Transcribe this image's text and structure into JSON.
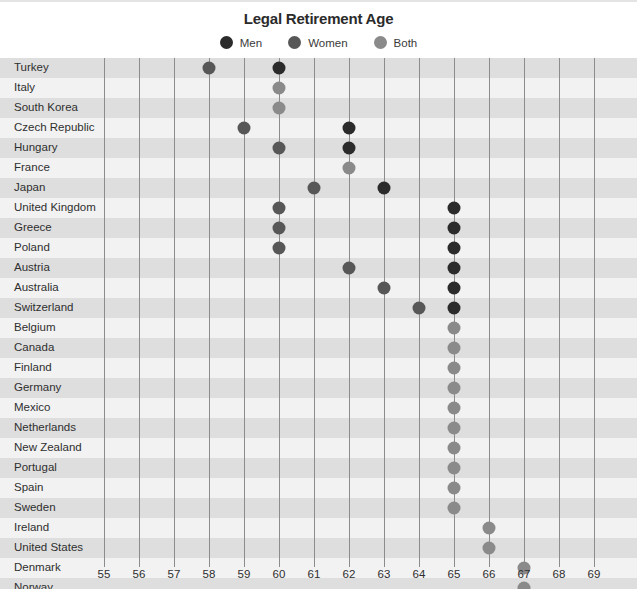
{
  "chart_data": {
    "type": "scatter",
    "title": "Legal Retirement Age",
    "xlabel": "",
    "ylabel": "",
    "xlim": [
      54.5,
      69.5
    ],
    "xticks": [
      55,
      56,
      57,
      58,
      59,
      60,
      61,
      62,
      63,
      64,
      65,
      66,
      67,
      68,
      69
    ],
    "grid": true,
    "legend_position": "top-center",
    "series": [
      {
        "name": "Men",
        "color": "#2b2b2b"
      },
      {
        "name": "Women",
        "color": "#575757"
      },
      {
        "name": "Both",
        "color": "#8a8a8a"
      }
    ],
    "categories": [
      "Turkey",
      "Italy",
      "South Korea",
      "Czech Republic",
      "Hungary",
      "France",
      "Japan",
      "United Kingdom",
      "Greece",
      "Poland",
      "Austria",
      "Australia",
      "Switzerland",
      "Belgium",
      "Canada",
      "Finland",
      "Germany",
      "Mexico",
      "Netherlands",
      "New Zealand",
      "Portugal",
      "Spain",
      "Sweden",
      "Ireland",
      "United States",
      "Denmark",
      "Norway"
    ],
    "rows": [
      {
        "country": "Turkey",
        "men": 60,
        "women": 58,
        "both": null
      },
      {
        "country": "Italy",
        "men": null,
        "women": null,
        "both": 60
      },
      {
        "country": "South Korea",
        "men": null,
        "women": null,
        "both": 60
      },
      {
        "country": "Czech Republic",
        "men": 62,
        "women": 59,
        "both": null
      },
      {
        "country": "Hungary",
        "men": 62,
        "women": 60,
        "both": null
      },
      {
        "country": "France",
        "men": null,
        "women": null,
        "both": 62
      },
      {
        "country": "Japan",
        "men": 63,
        "women": 61,
        "both": null
      },
      {
        "country": "United Kingdom",
        "men": 65,
        "women": 60,
        "both": null
      },
      {
        "country": "Greece",
        "men": 65,
        "women": 60,
        "both": null
      },
      {
        "country": "Poland",
        "men": 65,
        "women": 60,
        "both": null
      },
      {
        "country": "Austria",
        "men": 65,
        "women": 62,
        "both": null
      },
      {
        "country": "Australia",
        "men": 65,
        "women": 63,
        "both": null
      },
      {
        "country": "Switzerland",
        "men": 65,
        "women": 64,
        "both": null
      },
      {
        "country": "Belgium",
        "men": null,
        "women": null,
        "both": 65
      },
      {
        "country": "Canada",
        "men": null,
        "women": null,
        "both": 65
      },
      {
        "country": "Finland",
        "men": null,
        "women": null,
        "both": 65
      },
      {
        "country": "Germany",
        "men": null,
        "women": null,
        "both": 65
      },
      {
        "country": "Mexico",
        "men": null,
        "women": null,
        "both": 65
      },
      {
        "country": "Netherlands",
        "men": null,
        "women": null,
        "both": 65
      },
      {
        "country": "New Zealand",
        "men": null,
        "women": null,
        "both": 65
      },
      {
        "country": "Portugal",
        "men": null,
        "women": null,
        "both": 65
      },
      {
        "country": "Spain",
        "men": null,
        "women": null,
        "both": 65
      },
      {
        "country": "Sweden",
        "men": null,
        "women": null,
        "both": 65
      },
      {
        "country": "Ireland",
        "men": null,
        "women": null,
        "both": 66
      },
      {
        "country": "United States",
        "men": null,
        "women": null,
        "both": 66
      },
      {
        "country": "Denmark",
        "men": null,
        "women": null,
        "both": 67
      },
      {
        "country": "Norway",
        "men": null,
        "women": null,
        "both": 67
      }
    ]
  },
  "legend": {
    "items": [
      {
        "label": "Men",
        "color": "#2b2b2b",
        "icon": "circle-icon"
      },
      {
        "label": "Women",
        "color": "#575757",
        "icon": "circle-icon"
      },
      {
        "label": "Both",
        "color": "#8a8a8a",
        "icon": "circle-icon"
      }
    ]
  },
  "colors": {
    "band_dark": "#dedede",
    "band_light": "#f2f2f2",
    "gridline": "#8c8c8c",
    "text": "#2f2f2f",
    "title": "#2b2b2b"
  }
}
